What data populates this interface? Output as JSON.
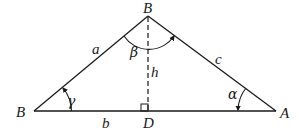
{
  "diagram": {
    "type": "triangle-with-altitude",
    "vertices": {
      "left": {
        "label": "B",
        "x": 34,
        "y": 111
      },
      "top": {
        "label": "B",
        "x": 148,
        "y": 16
      },
      "right": {
        "label": "A",
        "x": 276,
        "y": 111
      },
      "foot": {
        "label": "D",
        "x": 148,
        "y": 111
      }
    },
    "sides": {
      "left_side": "a",
      "right_side": "c",
      "base": "b",
      "altitude": "h"
    },
    "angles": {
      "at_left": "γ",
      "at_top": "β",
      "at_right": "α"
    },
    "colors": {
      "stroke": "#1a1a1a",
      "background": "#ffffff"
    }
  }
}
